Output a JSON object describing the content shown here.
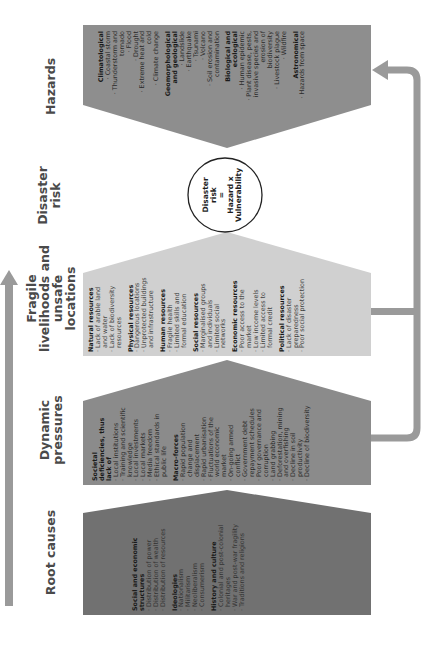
{
  "colors": {
    "root_causes": "#717171",
    "dynamic_pressures": "#8b8b8b",
    "fragile_livelihoods": "#d0d0d0",
    "hazards": "#8e8e8e",
    "arrow": "#9a9a9a",
    "circle_stroke": "#222222"
  },
  "titles": {
    "root_causes": "Root causes",
    "dynamic_pressures": "Dynamic pressures",
    "fragile_livelihoods": "Fragile livelihoods and unsafe locations",
    "disaster_risk": "Disaster risk",
    "hazards": "Hazards"
  },
  "formula": {
    "line1": "Disaster",
    "line2": "risk",
    "line3": "=",
    "line4": "Hazard x",
    "line5": "Vulnerability"
  },
  "root_causes": {
    "sections": [
      {
        "heading": "Social and economic structures",
        "items": [
          "Distribution of power",
          "Distribution of wealth",
          "Distribution of resources"
        ]
      },
      {
        "heading": "Ideologies",
        "items": [
          "Nationalism",
          "Militarism",
          "Neoliberalism",
          "Consumerism"
        ]
      },
      {
        "heading": "History and culture",
        "items": [
          "Colonial and post-colonial heritages",
          "War and post-war fragility",
          "Traditions and religions"
        ]
      }
    ]
  },
  "dynamic_pressures": {
    "sections": [
      {
        "heading": "Societal deficiencies, thus lack of",
        "items": [
          "Local institutions",
          "Training and scientific knowledge",
          "Local investments",
          "Local markets",
          "Media freedom",
          "Ethical standards in public life"
        ]
      },
      {
        "heading": "Macro-forces",
        "items": [
          "Rapid population change and displacement",
          "Rapid urbanisation",
          "Fluctuations of the world economic market",
          "On-going armed conflict",
          "Government debt repayment schedules",
          "Poor governance and corruption",
          "Land grabbing",
          "Deforestation, mining and overfishing",
          "Decline in soil productivity",
          "Decline of biodiversity"
        ]
      }
    ]
  },
  "fragile_livelihoods": {
    "sections": [
      {
        "heading": "Natural resources",
        "items": [
          "Lack of arable land and water",
          "Lack of biodiversity resources"
        ]
      },
      {
        "heading": "Physical resources",
        "items": [
          "Dangerous locations",
          "Unprotected buildings and infrastructure"
        ]
      },
      {
        "heading": "Human resources",
        "items": [
          "Fragile health",
          "Limited skills and formal education"
        ]
      },
      {
        "heading": "Social resources",
        "items": [
          "Marginalised groups and individuals",
          "Limited social networks"
        ]
      },
      {
        "heading": "Economic resources",
        "items": [
          "Poor access to the market",
          "Low income levels",
          "Limited access to formal credit"
        ]
      },
      {
        "heading": "Political resources",
        "items": [
          "Lack of disaster preparedness",
          "Poor social protection"
        ]
      }
    ]
  },
  "hazards": {
    "sections": [
      {
        "heading": "Climatological",
        "items": [
          "Coastal storm",
          "Thunderstorm and tornado",
          "Flood",
          "Drought",
          "Extreme heat and cold",
          "Climate change"
        ]
      },
      {
        "heading": "Geomorphological and geological",
        "items": [
          "Landslide",
          "Earthquake",
          "Tsunami",
          "Volcano",
          "Soil erosion and contamination"
        ]
      },
      {
        "heading": "Biological and ecological",
        "items": [
          "Human epidemic",
          "Plant disease, pests, invasive species and erosion of biodiversity",
          "Livestock plague",
          "Wildfire"
        ]
      },
      {
        "heading": "Astronomical",
        "items": [
          "Hazards from space"
        ]
      }
    ]
  }
}
